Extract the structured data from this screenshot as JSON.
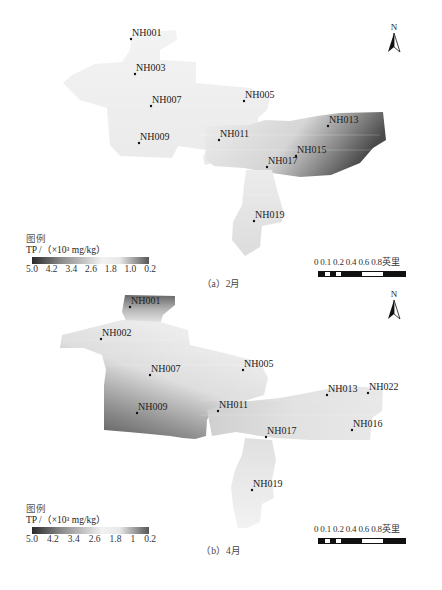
{
  "figure": {
    "panels": [
      {
        "id": "a",
        "caption": "（a）2月",
        "north_label": "N",
        "legend": {
          "title": "图例",
          "unit": "TP /（×10³ mg/kg）",
          "ticks": [
            "5.0",
            "4.2",
            "3.4",
            "2.6",
            "1.8",
            "1.0",
            "0.2"
          ]
        },
        "scale": {
          "values": "0 0.1 0.2 0.4   0.6   0.8英里"
        },
        "stations": [
          {
            "id": "NH001",
            "x": 131,
            "y": 39
          },
          {
            "id": "NH003",
            "x": 135,
            "y": 74
          },
          {
            "id": "NH007",
            "x": 151,
            "y": 106
          },
          {
            "id": "NH005",
            "x": 244,
            "y": 101
          },
          {
            "id": "NH009",
            "x": 139,
            "y": 143
          },
          {
            "id": "NH011",
            "x": 219,
            "y": 140
          },
          {
            "id": "NH013",
            "x": 328,
            "y": 126
          },
          {
            "id": "NH015",
            "x": 296,
            "y": 156
          },
          {
            "id": "NH017",
            "x": 267,
            "y": 167
          },
          {
            "id": "NH019",
            "x": 254,
            "y": 221
          }
        ]
      },
      {
        "id": "b",
        "caption": "（b）4月",
        "north_label": "N",
        "legend": {
          "title": "图例",
          "unit": "TP /（×10³ mg/kg）",
          "ticks": [
            "5.0",
            "4.2",
            "3.4",
            "2.6",
            "1.8",
            "1",
            "0.2"
          ]
        },
        "scale": {
          "values": "0 0.1 0.2 0.4   0.6   0.8英里"
        },
        "stations": [
          {
            "id": "NH001",
            "x": 130,
            "y": 307
          },
          {
            "id": "NH002",
            "x": 101,
            "y": 339
          },
          {
            "id": "NH007",
            "x": 150,
            "y": 375
          },
          {
            "id": "NH005",
            "x": 243,
            "y": 370
          },
          {
            "id": "NH009",
            "x": 137,
            "y": 413
          },
          {
            "id": "NH011",
            "x": 218,
            "y": 411
          },
          {
            "id": "NH013",
            "x": 327,
            "y": 395
          },
          {
            "id": "NH022",
            "x": 368,
            "y": 393
          },
          {
            "id": "NH016",
            "x": 352,
            "y": 430
          },
          {
            "id": "NH017",
            "x": 266,
            "y": 437
          },
          {
            "id": "NH019",
            "x": 252,
            "y": 490
          }
        ]
      }
    ]
  },
  "chart_data": [
    {
      "type": "heatmap",
      "title": "（a）2月",
      "variable": "TP",
      "unit": "×10³ mg/kg",
      "legend_range": [
        0.2,
        5.0
      ],
      "legend_ticks": [
        5.0,
        4.2,
        3.4,
        2.6,
        1.8,
        1.0,
        0.2
      ],
      "stations": [
        "NH001",
        "NH003",
        "NH005",
        "NH007",
        "NH009",
        "NH011",
        "NH013",
        "NH015",
        "NH017",
        "NH019"
      ],
      "notes": "Most of area light (low TP); highest TP (dark) at east end near NH013"
    },
    {
      "type": "heatmap",
      "title": "（b）4月",
      "variable": "TP",
      "unit": "×10³ mg/kg",
      "legend_range": [
        0.2,
        5.0
      ],
      "legend_ticks": [
        5.0,
        4.2,
        3.4,
        2.6,
        1.8,
        1,
        0.2
      ],
      "stations": [
        "NH001",
        "NH002",
        "NH005",
        "NH007",
        "NH009",
        "NH011",
        "NH013",
        "NH016",
        "NH017",
        "NH019",
        "NH022"
      ],
      "notes": "Higher TP (dark) in southwest near NH009 and at north tip near NH001; east area light"
    }
  ]
}
